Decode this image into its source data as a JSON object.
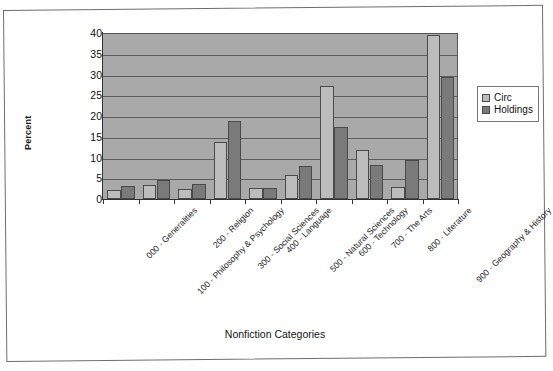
{
  "chart_data": {
    "type": "bar",
    "title": "",
    "xlabel": "Nonfiction Categories",
    "ylabel": "Percent",
    "ylim": [
      0,
      40
    ],
    "ytick_step": 5,
    "yticks": [
      40,
      35,
      30,
      25,
      20,
      15,
      10,
      5,
      0
    ],
    "grid": true,
    "legend_position": "right",
    "categories": [
      "000 - Generalities",
      "100 - Philosophy & Psychology",
      "200 - Religion",
      "300 - Social Sciences",
      "400 - Language",
      "500 - Natural Sciences",
      "600 - Technology",
      "700 - The Arts",
      "800 - Literature",
      "900 - Geography & History"
    ],
    "series": [
      {
        "name": "Circ",
        "color": "#bcbcbc",
        "values": [
          2.1,
          3.4,
          2.5,
          13.8,
          2.6,
          5.8,
          27.3,
          11.8,
          3.0,
          39.5
        ]
      },
      {
        "name": "Holdings",
        "color": "#7a7a7a",
        "values": [
          3.2,
          4.5,
          3.6,
          18.8,
          2.7,
          7.9,
          17.3,
          8.3,
          9.4,
          29.5
        ]
      }
    ]
  },
  "legend": {
    "entries": [
      {
        "label": "Circ",
        "icon": "square-swatch-light"
      },
      {
        "label": "Holdings",
        "icon": "square-swatch-dark"
      }
    ]
  },
  "axes": {
    "y_title": "Percent",
    "x_title": "Nonfiction Categories"
  },
  "colors": {
    "plot_background": "#a9a9a9",
    "page_background": "#ffffff",
    "gridline": "#5d5d5d",
    "axis": "#333333",
    "series_circ": "#bcbcbc",
    "series_holdings": "#7a7a7a"
  }
}
